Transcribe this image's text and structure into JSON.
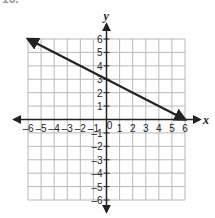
{
  "header": {
    "label": "16."
  },
  "chart_data": {
    "type": "line",
    "title": "",
    "xlabel": "x",
    "ylabel": "y",
    "xlim": [
      -6,
      6
    ],
    "ylim": [
      -6,
      6
    ],
    "grid": true,
    "x_ticks": [
      -6,
      -5,
      -4,
      -3,
      -2,
      -1,
      0,
      1,
      2,
      3,
      4,
      5,
      6
    ],
    "y_ticks": [
      -6,
      -5,
      -4,
      -3,
      -2,
      -1,
      1,
      2,
      3,
      4,
      5,
      6
    ],
    "series": [
      {
        "name": "line",
        "points": [
          [
            -6,
            6
          ],
          [
            0,
            3
          ],
          [
            6,
            0
          ]
        ],
        "slope": -0.5,
        "y_intercept": 3,
        "arrows": "both",
        "color": "#222222"
      }
    ]
  },
  "colors": {
    "grid": "#b8b8b8",
    "axis": "#222222",
    "line": "#222222"
  }
}
